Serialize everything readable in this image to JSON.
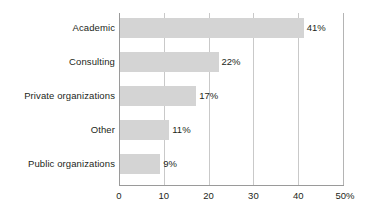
{
  "chart_data": {
    "type": "bar",
    "orientation": "horizontal",
    "title": "",
    "subtitle": "",
    "xlabel": "",
    "ylabel": "",
    "categories": [
      "Academic",
      "Consulting",
      "Private organizations",
      "Other",
      "Public organizations"
    ],
    "values": [
      41,
      22,
      17,
      11,
      9
    ],
    "value_labels": [
      "41%",
      "22%",
      "17%",
      "11%",
      "9%"
    ],
    "xlim": [
      0,
      50
    ],
    "xticks": [
      0,
      10,
      20,
      30,
      40,
      50
    ],
    "xtick_labels": [
      "0",
      "10",
      "20",
      "30",
      "40",
      "50%"
    ],
    "grid": "vertical",
    "legend": "none",
    "bar_color": "#d4d4d4",
    "gridline_color": "#c9c9c9",
    "axis_color": "#9a9a9a",
    "text_color": "#231f20",
    "background": "#ffffff"
  }
}
